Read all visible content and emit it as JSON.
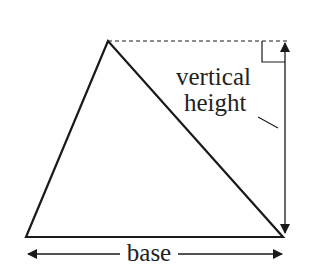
{
  "diagram": {
    "labels": {
      "vertical_line1": "vertical",
      "vertical_line2": "height",
      "base": "base"
    },
    "colors": {
      "stroke": "#1a1a1a",
      "text": "#222222",
      "background": "#ffffff"
    }
  }
}
